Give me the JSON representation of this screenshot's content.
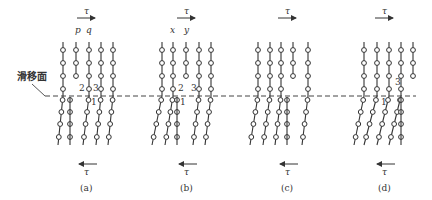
{
  "slip_plane_label": "滑移面",
  "tau_symbol": "τ",
  "slip_plane_y": 96,
  "slip_plane_x": [
    45,
    416
  ],
  "colors": {
    "line": "#333333",
    "dash": "#444444",
    "bg": "#ffffff"
  },
  "panels": [
    {
      "id": "a",
      "caption": "(a)",
      "cx": 87,
      "col_labels": [
        {
          "text": "p",
          "x": 77
        },
        {
          "text": "q",
          "x": 88
        }
      ],
      "top_cols": [
        63,
        76,
        89,
        101,
        113
      ],
      "top_rows": [
        50,
        63,
        76,
        89
      ],
      "top_short": [
        {
          "col": 1,
          "rows": [
            50,
            63,
            76
          ]
        }
      ],
      "bot_cols": [
        58,
        70,
        83,
        96,
        108
      ],
      "bot_rows": [
        100,
        112,
        124,
        137
      ],
      "numbers": [
        {
          "text": "2",
          "x": 79,
          "y": 91
        },
        {
          "text": "3",
          "x": 93,
          "y": 91
        },
        {
          "text": "1",
          "x": 91,
          "y": 105
        }
      ]
    },
    {
      "id": "b",
      "caption": "(b)",
      "cx": 187,
      "col_labels": [
        {
          "text": "x",
          "x": 172
        },
        {
          "text": "y",
          "x": 186
        }
      ],
      "top_cols": [
        162,
        173,
        186,
        199,
        211
      ],
      "top_rows": [
        50,
        63,
        76,
        89
      ],
      "top_short": [
        {
          "col": 2,
          "rows": [
            50,
            63,
            76
          ]
        }
      ],
      "bot_cols": [
        152,
        165,
        177,
        193,
        205
      ],
      "bot_rows": [
        100,
        112,
        124,
        137
      ],
      "numbers": [
        {
          "text": "2",
          "x": 178,
          "y": 91
        },
        {
          "text": "3",
          "x": 191,
          "y": 91
        },
        {
          "text": "1",
          "x": 180,
          "y": 105
        }
      ]
    },
    {
      "id": "c",
      "caption": "(c)",
      "cx": 288,
      "col_labels": [],
      "top_cols": [
        258,
        270,
        281,
        293,
        308
      ],
      "top_rows": [
        50,
        63,
        76,
        89
      ],
      "top_short": [
        {
          "col": 3,
          "rows": [
            50,
            63,
            76
          ]
        }
      ],
      "bot_cols": [
        250,
        263,
        275,
        287,
        302
      ],
      "bot_rows": [
        100,
        112,
        124,
        137
      ],
      "numbers": []
    },
    {
      "id": "d",
      "caption": "(d)",
      "cx": 385,
      "col_labels": [],
      "top_cols": [
        364,
        377,
        389,
        401,
        413
      ],
      "top_rows": [
        50,
        63,
        76,
        89
      ],
      "top_short": [
        {
          "col": 4,
          "rows": [
            50,
            63,
            76
          ]
        }
      ],
      "bot_cols": [
        354,
        364,
        377,
        389,
        401
      ],
      "bot_rows": [
        100,
        112,
        124,
        137
      ],
      "numbers": [
        {
          "text": "3",
          "x": 395,
          "y": 85
        },
        {
          "text": "1",
          "x": 381,
          "y": 105
        }
      ]
    }
  ]
}
